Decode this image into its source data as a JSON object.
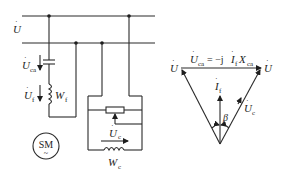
{
  "circuit": {
    "supply_label": "U",
    "capacitor_voltage_label": "U",
    "capacitor_voltage_sub": "ca",
    "field_voltage_label": "U",
    "field_voltage_sub": "f",
    "field_winding_label": "W",
    "field_winding_sub": "f",
    "control_voltage_label": "U",
    "control_voltage_sub": "c",
    "control_winding_label": "W",
    "control_winding_sub": "c",
    "machine_label": "SM",
    "machine_symbol": "~"
  },
  "phasor": {
    "left_vertex_label": "U",
    "right_vertex_label": "U",
    "top_equation_lhs": "U",
    "top_equation_lhs_sub": "ca",
    "top_equation_mid": " = −j",
    "top_equation_current": "I",
    "top_equation_current_sub": "f",
    "top_equation_reactance": "X",
    "top_equation_reactance_sub": "ca",
    "current_label": "I",
    "current_sub": "f",
    "angle_label": "β",
    "control_label": "U",
    "control_sub": "c"
  }
}
